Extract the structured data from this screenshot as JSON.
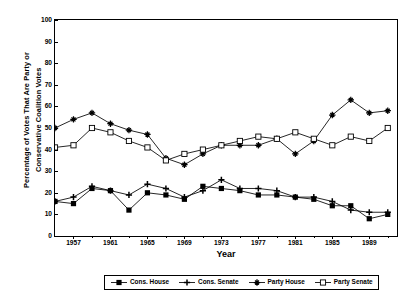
{
  "chart_data": {
    "type": "line",
    "title": "",
    "xlabel": "Year",
    "ylabel": "Percentage of Votes That Are Party or Conservative Coalition Votes",
    "ylabel_line1": "Percentage of Votes That Are Party or",
    "ylabel_line2": "Conservative Coalition Votes",
    "xlim": [
      1955,
      1992
    ],
    "ylim": [
      0,
      100
    ],
    "yticks": [
      0,
      10,
      20,
      30,
      40,
      50,
      60,
      70,
      80,
      90,
      100
    ],
    "xticks": [
      1957,
      1961,
      1965,
      1969,
      1973,
      1977,
      1981,
      1985,
      1989
    ],
    "xticks_minor": [
      1959,
      1963,
      1967,
      1971,
      1975,
      1979,
      1983,
      1987,
      1991
    ],
    "grid": false,
    "legend_position": "bottom-outside",
    "x": [
      1955,
      1957,
      1959,
      1961,
      1963,
      1965,
      1967,
      1969,
      1971,
      1973,
      1975,
      1977,
      1979,
      1981,
      1983,
      1985,
      1987,
      1989,
      1991
    ],
    "series": [
      {
        "name": "Cons. House",
        "marker": "filled-square",
        "color": "#000000",
        "values": [
          16,
          15,
          22,
          21,
          12,
          20,
          19,
          17,
          23,
          22,
          21,
          19,
          19,
          18,
          17,
          14,
          14,
          8,
          10
        ]
      },
      {
        "name": "Cons. Senate",
        "marker": "plus",
        "color": "#000000",
        "values": [
          16,
          18,
          23,
          21,
          19,
          24,
          22,
          18,
          21,
          26,
          22,
          22,
          21,
          18,
          18,
          16,
          12,
          11,
          11
        ]
      },
      {
        "name": "Party House",
        "marker": "asterisk",
        "color": "#000000",
        "values": [
          50,
          54,
          57,
          52,
          49,
          47,
          36,
          33,
          38,
          42,
          42,
          42,
          45,
          38,
          44,
          56,
          63,
          57,
          58
        ]
      },
      {
        "name": "Party Senate",
        "marker": "open-square",
        "color": "#000000",
        "values": [
          41,
          42,
          50,
          48,
          44,
          41,
          35,
          38,
          40,
          42,
          44,
          46,
          45,
          48,
          45,
          42,
          46,
          44,
          50
        ]
      }
    ]
  },
  "legend": {
    "items": [
      {
        "label": "Cons. House"
      },
      {
        "label": "Cons. Senate"
      },
      {
        "label": "Party House"
      },
      {
        "label": "Party Senate"
      }
    ]
  }
}
